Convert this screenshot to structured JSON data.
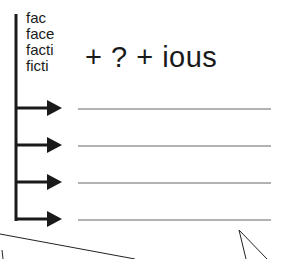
{
  "word_roots": {
    "items": [
      "fac",
      "face",
      "facti",
      "ficti"
    ]
  },
  "formula": {
    "text": "+ ? + ious",
    "parts": [
      "+",
      "?",
      "+",
      "ious"
    ]
  },
  "answer_blanks": {
    "count": 4,
    "values": [
      "",
      "",
      "",
      ""
    ]
  },
  "colors": {
    "ink": "#1a1a1a",
    "line": "#666666",
    "background": "#ffffff"
  }
}
